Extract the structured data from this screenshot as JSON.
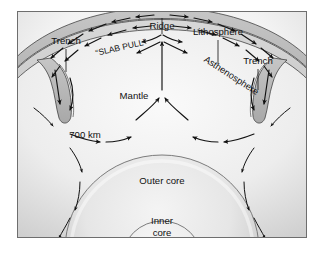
{
  "figure": {
    "background_color": "#ffffff",
    "panel_color": "#fbfbfb",
    "frame_color": "#6e6e6e"
  },
  "labels": {
    "trench_left": "Trench",
    "trench_right": "Trench",
    "slab_pull": "“SLAB PULL”",
    "ridge": "Ridge",
    "lithosphere": "Lithosphere",
    "asthenosphere": "Asthenosphere",
    "mantle": "Mantle",
    "depth_700": "700 km",
    "outer_core": "Outer core",
    "inner_core_line1": "Inner",
    "inner_core_line2": "core"
  },
  "layers": [
    {
      "name": "lithosphere",
      "label": "Lithosphere",
      "fill": "#b9b9b9",
      "stroke": "#3a3a3a",
      "description": "Rigid outer shell band at top of section"
    },
    {
      "name": "asthenosphere",
      "label": "Asthenosphere",
      "fill": "#cfcfcf",
      "stroke": "#3a3a3a",
      "description": "Weak band directly beneath lithosphere"
    },
    {
      "name": "mantle",
      "label": "Mantle",
      "fill": "#ececec",
      "stroke": "#8a8a8a",
      "description": "Convecting interior between asthenosphere and outer core"
    },
    {
      "name": "outer-core",
      "label": "Outer core",
      "fill": "#e3e3e3",
      "stroke": "#6e6e6e",
      "description": "Liquid core shell"
    },
    {
      "name": "inner-core",
      "label": "Inner core",
      "fill": "#efefef",
      "stroke": "#6e6e6e",
      "description": "Solid central sphere"
    }
  ],
  "features": [
    {
      "name": "ridge",
      "label": "Ridge",
      "type": "divergent-boundary",
      "position": "top-center"
    },
    {
      "name": "trench-left",
      "label": "Trench",
      "type": "subduction-zone",
      "position": "upper-left"
    },
    {
      "name": "trench-right",
      "label": "Trench",
      "type": "subduction-zone",
      "position": "upper-right"
    },
    {
      "name": "slab-pull",
      "label": "“SLAB PULL”",
      "type": "force-annotation",
      "position": "upper-left"
    },
    {
      "name": "depth-marker-700km",
      "label": "700 km",
      "type": "depth-annotation",
      "position": "mid-left"
    }
  ],
  "flow_arrows": {
    "description": "Mantle convection cells: plates move from ridge toward trenches, slabs sink, deep return flow rises at ridge",
    "directions": [
      "ridge-divergence",
      "plate-spreading",
      "slab-descent",
      "deep-return-flow",
      "central-upwelling"
    ]
  }
}
